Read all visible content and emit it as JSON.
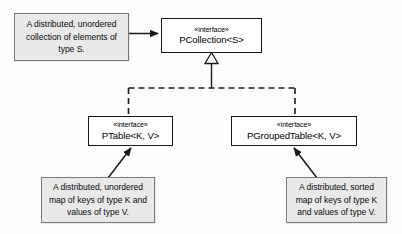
{
  "diagram": {
    "type": "uml-class-diagram",
    "background_color": "#fdfdfd",
    "note_fill_color": "#e9e9e9",
    "note_border_color": "#7a7a7a",
    "interface_border_color": "#171717",
    "interface_fill_color": "#ffffff",
    "line_color": "#1a1a1a"
  },
  "interfaces": {
    "pcollection": {
      "stereotype": "«interface»",
      "name": "PCollection<S>"
    },
    "ptable": {
      "stereotype": "«interface»",
      "name": "PTable<K, V>"
    },
    "pgroupedtable": {
      "stereotype": "«interface»",
      "name": "PGroupedTable<K, V>"
    }
  },
  "notes": {
    "pcollection_note": {
      "text": "A distributed, unordered collection of elements of type S."
    },
    "ptable_note": {
      "text": "A distributed, unordered map of keys of type K and values of type V."
    },
    "pgroupedtable_note": {
      "text": "A distributed, sorted map of keys of type K and values of type V."
    }
  },
  "connectors": {
    "note_to_pcollection": {
      "kind": "note-anchor-arrow",
      "style": "solid"
    },
    "generalization": {
      "kind": "generalization",
      "style": "dashed",
      "arrowhead": "hollow-triangle",
      "from": [
        "PTable<K, V>",
        "PGroupedTable<K, V>"
      ],
      "to": "PCollection<S>"
    },
    "note_to_ptable": {
      "kind": "note-anchor-arrow",
      "style": "solid"
    },
    "note_to_pgroupedtable": {
      "kind": "note-anchor-arrow",
      "style": "solid"
    }
  }
}
